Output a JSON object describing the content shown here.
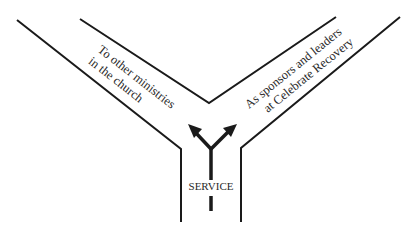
{
  "diagram": {
    "type": "y-junction-path",
    "branches": [
      {
        "id": "left",
        "label_lines": [
          "To other ministries",
          "in the church"
        ]
      },
      {
        "id": "right",
        "label_lines": [
          "As sponsors and leaders",
          "at Celebrate Recovery"
        ]
      }
    ],
    "stem_label": "SERVICE",
    "colors": {
      "line": "#1a1a1a",
      "text": "#2a2a2a",
      "background": "#ffffff"
    }
  }
}
